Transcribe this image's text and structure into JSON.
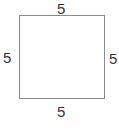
{
  "diagram": {
    "shape": "square",
    "sides": {
      "top": "5",
      "left": "5",
      "right": "5",
      "bottom": "5"
    },
    "colors": {
      "stroke": "#8a8a8a",
      "text": "#333333",
      "background": "#ffffff"
    }
  }
}
